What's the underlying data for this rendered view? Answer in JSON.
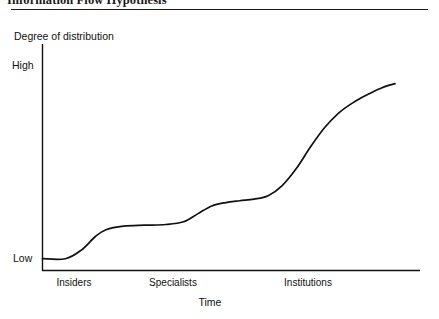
{
  "figure": {
    "caption": "Information Flow Hypothesis",
    "rule_color": "#1c1c1c"
  },
  "chart_data": {
    "type": "line",
    "title": "Information Flow Hypothesis",
    "xlabel": "Time",
    "ylabel": "Degree of distribution",
    "ylim": [
      0,
      1
    ],
    "ytick_labels": [
      "Low",
      "High"
    ],
    "ytick_values": [
      0.05,
      0.93
    ],
    "xtick_labels": [
      "Insiders",
      "Specialists",
      "Institutions"
    ],
    "xtick_values": [
      0.09,
      0.39,
      0.77
    ],
    "grid": false,
    "legend": null,
    "line_color": "#111111",
    "line_width": 1.7,
    "series": [
      {
        "name": "Degree of distribution",
        "x": [
          0.0,
          0.065,
          0.11,
          0.15,
          0.18,
          0.23,
          0.29,
          0.35,
          0.4,
          0.44,
          0.48,
          0.52,
          0.56,
          0.6,
          0.64,
          0.68,
          0.72,
          0.76,
          0.8,
          0.84,
          0.88,
          0.92,
          0.96,
          1.0
        ],
        "y": [
          0.052,
          0.052,
          0.09,
          0.15,
          0.18,
          0.196,
          0.2,
          0.203,
          0.215,
          0.25,
          0.285,
          0.3,
          0.308,
          0.315,
          0.33,
          0.375,
          0.45,
          0.545,
          0.63,
          0.695,
          0.74,
          0.775,
          0.805,
          0.825
        ]
      }
    ],
    "annotations": [
      "Curve is a stepped S-shape: flat at Low across the Insiders stage, a first rise to a plateau before Specialists, a second plateau, then a steep climb through Institutions that flattens near High."
    ]
  }
}
